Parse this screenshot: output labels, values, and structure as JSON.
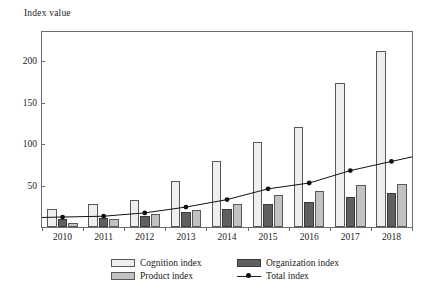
{
  "chart_data": {
    "type": "bar",
    "title": "",
    "subtitle": "",
    "xlabel": "",
    "ylabel": "Index value",
    "categories": [
      "2010",
      "2011",
      "2012",
      "2013",
      "2014",
      "2015",
      "2016",
      "2017",
      "2018"
    ],
    "ylim": [
      0,
      235
    ],
    "yticks": [
      50,
      100,
      150,
      200
    ],
    "grid": false,
    "legend_position": "bottom",
    "series": [
      {
        "name": "Cognition index",
        "chart_type": "bar",
        "color": "#efefef",
        "values": [
          22,
          28,
          33,
          55,
          79,
          102,
          121,
          173,
          212
        ]
      },
      {
        "name": "Organization index",
        "chart_type": "bar",
        "color": "#5f5f5f",
        "values": [
          10,
          11,
          13,
          18,
          22,
          28,
          30,
          36,
          41
        ]
      },
      {
        "name": "Product index",
        "chart_type": "bar",
        "color": "#c2c2c2",
        "values": [
          5,
          10,
          16,
          21,
          28,
          38,
          43,
          51,
          52
        ]
      },
      {
        "name": "Total index",
        "chart_type": "line",
        "color": "#111111",
        "marker": "circle",
        "values": [
          12,
          13,
          17,
          24,
          33,
          46,
          53,
          68,
          79
        ]
      }
    ]
  },
  "axis": {
    "y_title": "Index value",
    "y_tick_labels": [
      "50",
      "100",
      "150",
      "200"
    ],
    "x_tick_labels": [
      "2010",
      "2011",
      "2012",
      "2013",
      "2014",
      "2015",
      "2016",
      "2017",
      "2018"
    ]
  },
  "legend": {
    "entries": [
      {
        "label": "Cognition index",
        "swatch": "cognition-swatch"
      },
      {
        "label": "Organization index",
        "swatch": "organization-swatch"
      },
      {
        "label": "Product index",
        "swatch": "product-swatch"
      },
      {
        "label": "Total index",
        "swatch": "total-line-marker"
      }
    ]
  },
  "colors": {
    "cognition": "#efefef",
    "organization": "#5f5f5f",
    "product": "#c2c2c2",
    "total_line": "#111111",
    "frame": "#6d6d6d",
    "background": "#ffffff"
  }
}
